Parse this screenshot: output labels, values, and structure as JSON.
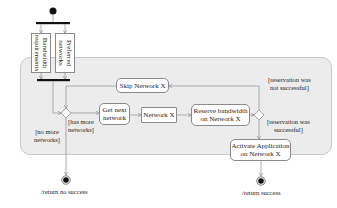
{
  "diagram": {
    "type": "UML activity diagram",
    "objects": [
      {
        "id": "bandwidth_requirements",
        "label": "Bandwidth\nrequirements"
      },
      {
        "id": "preferred_networks",
        "label": "Preferred\nnetworks"
      }
    ],
    "actions": {
      "skip": "Skip Network X",
      "get_next": "Get next\nnetwork",
      "network_x": "Network X",
      "reserve": "Reserve bandwidth\non Network X",
      "activate": "Activate Application\non Network X"
    },
    "guards": {
      "no_more": "[no more\nnetworks]",
      "has_more": "[has more\nnetworks]",
      "not_successful": "[reservation was\nnot successful]",
      "successful": "[reservation was\nsuccessful]"
    },
    "finals": {
      "no_success": "/return no success",
      "success": "/return success"
    },
    "colors": {
      "region_fill": "#ececec",
      "node_border": "#8a8a8a",
      "edge": "#9a9a9a",
      "bar": "#111111"
    }
  }
}
